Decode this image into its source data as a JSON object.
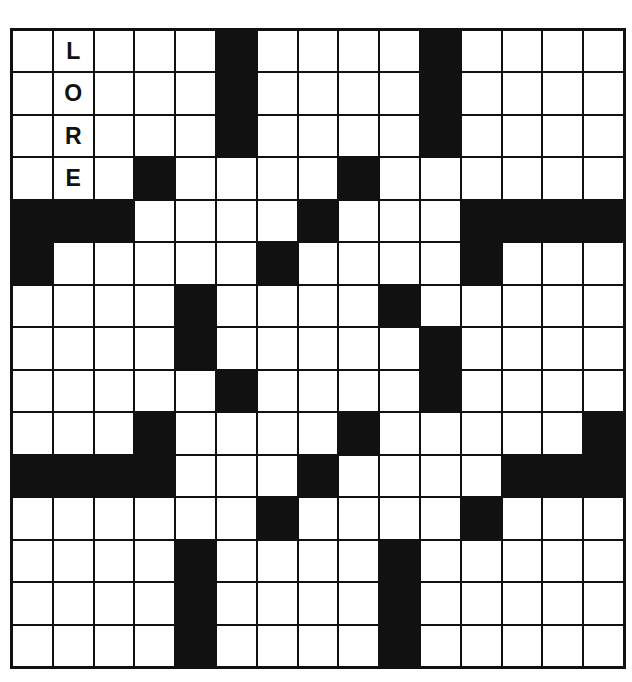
{
  "puzzle": {
    "rows": 15,
    "cols": 15,
    "colors": {
      "block": "#111111",
      "open": "#ffffff",
      "grid_line": "#111111",
      "letter": "#111111"
    },
    "black_cells": [
      [
        0,
        5
      ],
      [
        0,
        10
      ],
      [
        1,
        5
      ],
      [
        1,
        10
      ],
      [
        2,
        5
      ],
      [
        2,
        10
      ],
      [
        3,
        3
      ],
      [
        3,
        8
      ],
      [
        4,
        0
      ],
      [
        4,
        1
      ],
      [
        4,
        2
      ],
      [
        4,
        7
      ],
      [
        4,
        11
      ],
      [
        4,
        12
      ],
      [
        4,
        13
      ],
      [
        4,
        14
      ],
      [
        5,
        0
      ],
      [
        5,
        6
      ],
      [
        5,
        11
      ],
      [
        6,
        4
      ],
      [
        6,
        9
      ],
      [
        7,
        4
      ],
      [
        7,
        10
      ],
      [
        8,
        5
      ],
      [
        8,
        10
      ],
      [
        9,
        3
      ],
      [
        9,
        8
      ],
      [
        9,
        14
      ],
      [
        10,
        0
      ],
      [
        10,
        1
      ],
      [
        10,
        2
      ],
      [
        10,
        3
      ],
      [
        10,
        7
      ],
      [
        10,
        12
      ],
      [
        10,
        13
      ],
      [
        10,
        14
      ],
      [
        11,
        6
      ],
      [
        11,
        11
      ],
      [
        12,
        4
      ],
      [
        12,
        9
      ],
      [
        13,
        4
      ],
      [
        13,
        9
      ],
      [
        14,
        4
      ],
      [
        14,
        9
      ]
    ],
    "filled_letters": [
      {
        "row": 0,
        "col": 1,
        "letter": "L"
      },
      {
        "row": 1,
        "col": 1,
        "letter": "O"
      },
      {
        "row": 2,
        "col": 1,
        "letter": "R"
      },
      {
        "row": 3,
        "col": 1,
        "letter": "E"
      }
    ],
    "entered_word": {
      "direction": "down",
      "start_row": 0,
      "start_col": 1,
      "text": "LORE"
    }
  }
}
